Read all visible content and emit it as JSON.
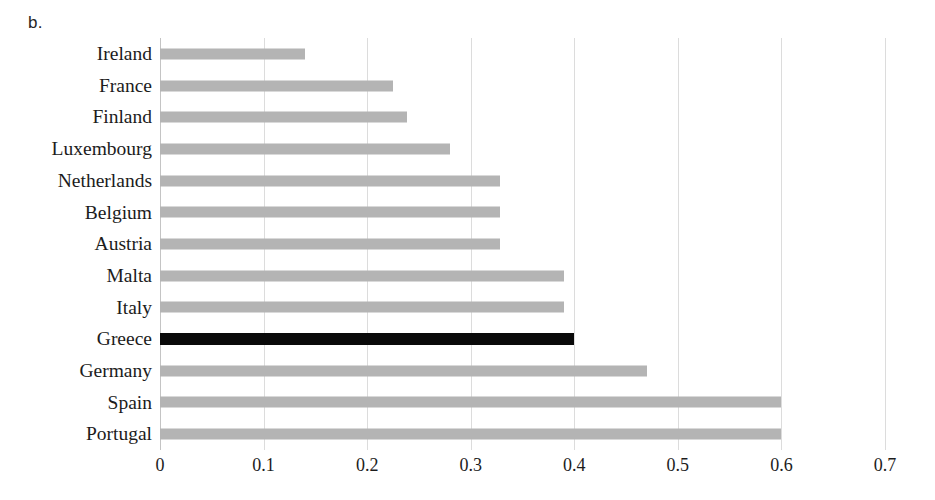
{
  "panel": {
    "label": "b."
  },
  "chart_data": {
    "type": "bar",
    "orientation": "horizontal",
    "title": "",
    "subtitle": "",
    "xlabel": "",
    "ylabel": "",
    "categories": [
      "Ireland",
      "France",
      "Finland",
      "Luxembourg",
      "Netherlands",
      "Belgium",
      "Austria",
      "Malta",
      "Italy",
      "Greece",
      "Germany",
      "Spain",
      "Portugal"
    ],
    "values": [
      0.14,
      0.225,
      0.238,
      0.28,
      0.328,
      0.328,
      0.328,
      0.39,
      0.39,
      0.4,
      0.47,
      0.6,
      0.6
    ],
    "highlight_category": "Greece",
    "xlim": [
      0,
      0.7
    ],
    "ylim": null,
    "xticks": [
      0,
      0.1,
      0.2,
      0.3,
      0.4,
      0.5,
      0.6,
      0.7
    ],
    "xtick_labels": [
      "0",
      "0.1",
      "0.2",
      "0.3",
      "0.4",
      "0.5",
      "0.6",
      "0.7"
    ],
    "grid": "vertical",
    "legend": null,
    "legend_position": "none",
    "annotations": [],
    "colors": {
      "bar": "#b4b4b4",
      "bar_highlight": "#0a0a0a",
      "gridline": "#dcdcdc",
      "axis": "#c4c4c4",
      "text": "#1c1c1c",
      "background": "#ffffff"
    }
  }
}
